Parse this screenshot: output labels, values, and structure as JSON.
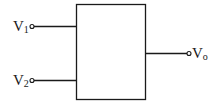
{
  "diagram": {
    "type": "block-diagram",
    "block": {
      "label": ""
    },
    "inputs": [
      {
        "name": "V",
        "subscript": "1"
      },
      {
        "name": "V",
        "subscript": "2"
      }
    ],
    "output": {
      "name": "V",
      "subscript": "o"
    }
  }
}
